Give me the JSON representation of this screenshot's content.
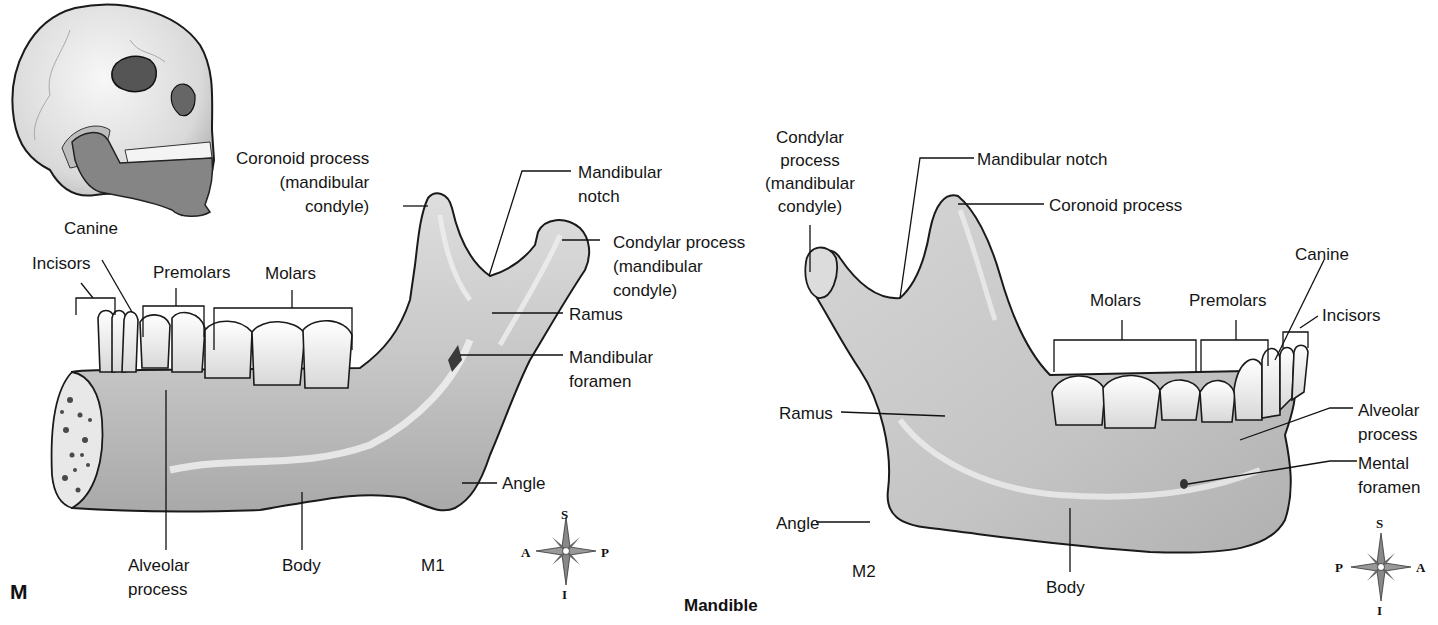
{
  "figure": {
    "panel_letter": "M",
    "caption": "Mandible",
    "views": [
      {
        "id": "M1",
        "view": "lateral view (right side)",
        "labels": {
          "coronoid": [
            "Coronoid process",
            "(mandibular",
            "condyle)"
          ],
          "mandibular_notch": [
            "Mandibular",
            "notch"
          ],
          "condylar": [
            "Condylar process",
            "(mandibular",
            "condyle)"
          ],
          "ramus": "Ramus",
          "mandibular_foramen": [
            "Mandibular",
            "foramen"
          ],
          "angle": "Angle",
          "body": "Body",
          "alveolar": [
            "Alveolar",
            "process"
          ],
          "canine": "Canine",
          "incisors": "Incisors",
          "premolars": "Premolars",
          "molars": "Molars"
        },
        "compass": {
          "top": "S",
          "bottom": "I",
          "left": "A",
          "right": "P"
        }
      },
      {
        "id": "M2",
        "view": "lateral view (left side)",
        "labels": {
          "condylar": [
            "Condylar",
            "process",
            "(mandibular",
            "condyle)"
          ],
          "mandibular_notch": "Mandibular notch",
          "coronoid": "Coronoid process",
          "molars": "Molars",
          "premolars": "Premolars",
          "canine": "Canine",
          "incisors": "Incisors",
          "ramus": "Ramus",
          "alveolar": [
            "Alveolar",
            "process"
          ],
          "mental_foramen": [
            "Mental",
            "foramen"
          ],
          "angle": "Angle",
          "body": "Body"
        },
        "compass": {
          "top": "S",
          "bottom": "I",
          "left": "P",
          "right": "A"
        }
      }
    ]
  },
  "colors": {
    "bone": "#c9c9c9",
    "bone_light": "#e4e4e4",
    "bone_shadow": "#9a9a9a",
    "outline": "#1a1a1a",
    "tooth": "#f1f1f1",
    "mandible_highlight": "#7f7f7f"
  }
}
